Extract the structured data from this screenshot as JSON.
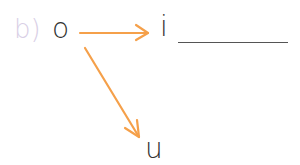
{
  "exercise": {
    "label": "b)",
    "start_letter": "o",
    "targets": [
      {
        "letter": "i",
        "has_blank": true
      },
      {
        "letter": "u",
        "has_blank": false
      }
    ]
  },
  "colors": {
    "label": "#d9cfe6",
    "arrow": "#f5a04a",
    "text": "#333333"
  }
}
